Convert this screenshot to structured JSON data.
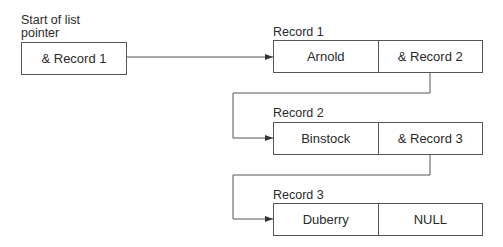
{
  "diagram": {
    "type": "linked-list",
    "start": {
      "label_line1": "Start of list",
      "label_line2": "pointer",
      "value": "& Record 1"
    },
    "records": [
      {
        "title": "Record 1",
        "name": "Arnold",
        "next": "& Record 2"
      },
      {
        "title": "Record 2",
        "name": "Binstock",
        "next": "& Record 3"
      },
      {
        "title": "Record 3",
        "name": "Duberry",
        "next": "NULL"
      }
    ],
    "colors": {
      "line": "#444444",
      "text": "#2a2a2a",
      "background": "#ffffff"
    }
  }
}
